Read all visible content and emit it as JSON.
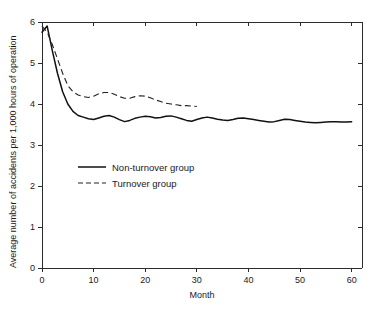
{
  "chart_data": {
    "type": "line",
    "title": "",
    "xlabel": "Month",
    "ylabel": "Average number of accidents per 1,000 hours of operation",
    "xlim": [
      0,
      62
    ],
    "ylim": [
      0,
      6
    ],
    "xticks": [
      0,
      10,
      20,
      30,
      40,
      50,
      60
    ],
    "xtick_labels": [
      "0",
      "10",
      "20",
      "30",
      "40",
      "50",
      "60"
    ],
    "yticks": [
      0,
      1,
      2,
      3,
      4,
      5,
      6
    ],
    "ytick_labels": [
      "0",
      "1",
      "2",
      "3",
      "4",
      "5",
      "6"
    ],
    "grid": false,
    "legend_position": "center-left",
    "series": [
      {
        "name": "Non-turnover group",
        "style": "solid",
        "color": "#111111",
        "x": [
          0,
          1,
          2,
          3,
          4,
          5,
          6,
          7,
          8,
          9,
          10,
          11,
          12,
          13,
          14,
          15,
          16,
          17,
          18,
          19,
          20,
          21,
          22,
          23,
          24,
          25,
          26,
          27,
          28,
          29,
          30,
          31,
          32,
          33,
          34,
          35,
          36,
          37,
          38,
          39,
          40,
          41,
          42,
          43,
          44,
          45,
          46,
          47,
          48,
          49,
          50,
          51,
          52,
          53,
          54,
          55,
          56,
          57,
          58,
          59,
          60
        ],
        "values": [
          5.75,
          5.9,
          5.3,
          4.75,
          4.3,
          4.0,
          3.82,
          3.72,
          3.68,
          3.64,
          3.62,
          3.66,
          3.7,
          3.72,
          3.68,
          3.62,
          3.57,
          3.6,
          3.65,
          3.68,
          3.7,
          3.69,
          3.66,
          3.67,
          3.7,
          3.71,
          3.68,
          3.64,
          3.6,
          3.58,
          3.62,
          3.66,
          3.68,
          3.66,
          3.63,
          3.61,
          3.6,
          3.62,
          3.65,
          3.66,
          3.64,
          3.62,
          3.6,
          3.58,
          3.56,
          3.57,
          3.6,
          3.63,
          3.62,
          3.6,
          3.58,
          3.56,
          3.55,
          3.54,
          3.55,
          3.56,
          3.57,
          3.57,
          3.56,
          3.56,
          3.57
        ]
      },
      {
        "name": "Turnover group",
        "style": "dashed",
        "color": "#222222",
        "x": [
          0,
          1,
          2,
          3,
          4,
          5,
          6,
          7,
          8,
          9,
          10,
          11,
          12,
          13,
          14,
          15,
          16,
          17,
          18,
          19,
          20,
          21,
          22,
          23,
          24,
          25,
          26,
          27,
          28,
          29,
          30
        ],
        "values": [
          5.9,
          5.75,
          5.45,
          5.1,
          4.75,
          4.45,
          4.3,
          4.22,
          4.18,
          4.16,
          4.19,
          4.25,
          4.28,
          4.28,
          4.24,
          4.18,
          4.14,
          4.14,
          4.18,
          4.2,
          4.19,
          4.15,
          4.1,
          4.06,
          4.02,
          4.0,
          3.98,
          3.96,
          3.96,
          3.95,
          3.94
        ]
      }
    ]
  },
  "legend": {
    "entries": [
      {
        "label": "Non-turnover group",
        "style": "solid"
      },
      {
        "label": "Turnover group",
        "style": "dashed"
      }
    ]
  }
}
